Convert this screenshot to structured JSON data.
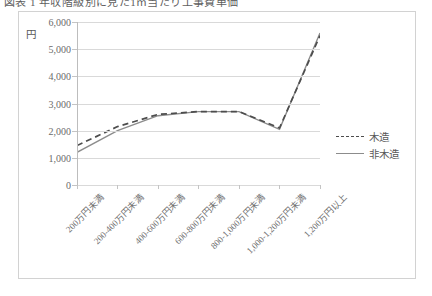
{
  "figure": {
    "title": "図表 1 年収階級別に見た1㎡当たり工事費単価",
    "unit_label": "円",
    "frame_color": "#d2d2d2"
  },
  "legend": {
    "position": "right-middle",
    "entries": [
      {
        "label": "木造",
        "style": "dashed",
        "color": "#4d4d4d"
      },
      {
        "label": "非木造",
        "style": "solid",
        "color": "#8c8c8c"
      }
    ]
  },
  "chart_data": {
    "type": "line",
    "title": "図表 1 年収階級別に見た1㎡当たり工事費単価",
    "xlabel": "",
    "ylabel": "円",
    "ylim": [
      0,
      6000
    ],
    "ytick_step": 1000,
    "ytick_labels": [
      "6,000",
      "5,000",
      "4,000",
      "3,000",
      "2,000",
      "1,000",
      "0"
    ],
    "ytick_values": [
      6000,
      5000,
      4000,
      3000,
      2000,
      1000,
      0
    ],
    "grid": true,
    "legend_position": "right",
    "categories": [
      "200万円未満",
      "200-400万円未満",
      "400-600万円未満",
      "600-800万円未満",
      "800-1,000万円未満",
      "1,000-1,200万円未満",
      "1,200万円以上"
    ],
    "series": [
      {
        "name": "木造",
        "style": "dashed",
        "color": "#4d4d4d",
        "values": [
          1450,
          2150,
          2600,
          2700,
          2700,
          2100,
          3550
        ]
      },
      {
        "name": "非木造",
        "style": "solid",
        "color": "#8c8c8c",
        "values": [
          1200,
          2000,
          2550,
          2700,
          2700,
          2050,
          4700
        ]
      }
    ],
    "series_final_values": {
      "木造": 5500,
      "非木造": 5600
    }
  }
}
